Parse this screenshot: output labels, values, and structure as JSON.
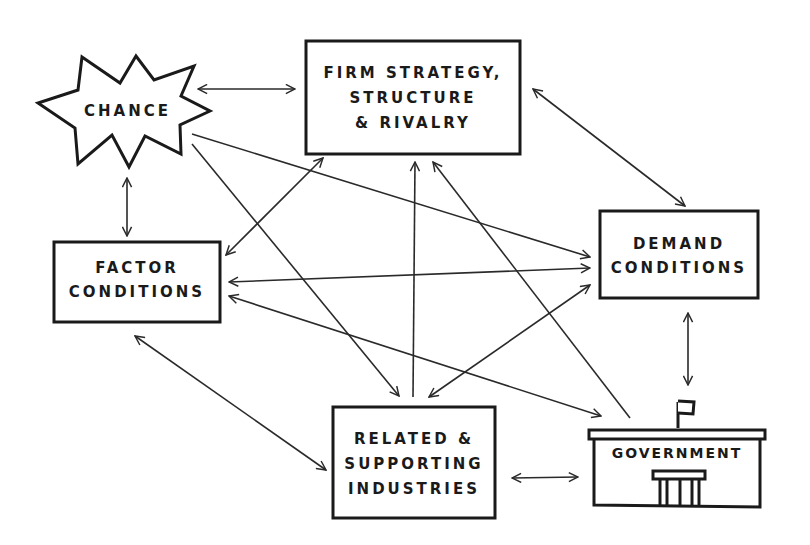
{
  "diagram": {
    "colors": {
      "stroke": "#1a1a1a",
      "background": "#ffffff"
    },
    "nodes": {
      "chance": {
        "shape": "starburst",
        "lines": [
          "CHANCE"
        ]
      },
      "firm": {
        "shape": "rectangle",
        "lines": [
          "FIRM STRATEGY,",
          "STRUCTURE",
          "& RIVALRY"
        ]
      },
      "factor": {
        "shape": "rectangle",
        "lines": [
          "FACTOR",
          "CONDITIONS"
        ]
      },
      "demand": {
        "shape": "rectangle",
        "lines": [
          "DEMAND",
          "CONDITIONS"
        ]
      },
      "related": {
        "shape": "rectangle",
        "lines": [
          "RELATED &",
          "SUPPORTING",
          "INDUSTRIES"
        ]
      },
      "government": {
        "shape": "building",
        "icon": "government-building-icon",
        "lines": [
          "GOVERNMENT"
        ]
      }
    },
    "edges": [
      {
        "from": "chance",
        "to": "firm",
        "direction": "both"
      },
      {
        "from": "chance",
        "to": "factor",
        "direction": "both"
      },
      {
        "from": "chance",
        "to": "demand",
        "direction": "forward"
      },
      {
        "from": "chance",
        "to": "related",
        "direction": "forward"
      },
      {
        "from": "firm",
        "to": "factor",
        "direction": "both"
      },
      {
        "from": "firm",
        "to": "demand",
        "direction": "both"
      },
      {
        "from": "related",
        "to": "firm",
        "direction": "forward"
      },
      {
        "from": "government",
        "to": "firm",
        "direction": "forward"
      },
      {
        "from": "factor",
        "to": "demand",
        "direction": "both"
      },
      {
        "from": "factor",
        "to": "government",
        "direction": "both"
      },
      {
        "from": "related",
        "to": "demand",
        "direction": "both"
      },
      {
        "from": "factor",
        "to": "related",
        "direction": "both"
      },
      {
        "from": "demand",
        "to": "government",
        "direction": "both"
      },
      {
        "from": "related",
        "to": "government",
        "direction": "both"
      }
    ]
  }
}
